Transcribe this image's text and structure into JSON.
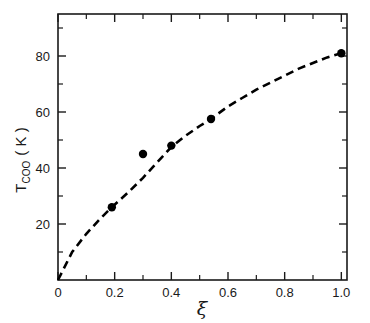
{
  "chart_data": {
    "type": "scatter",
    "title": "",
    "subtitle": "",
    "xlabel": "ξ",
    "ylabel": "T_COO (K)",
    "ylabel_parts": {
      "main": "T",
      "subscript": "COO",
      "units": "( K )"
    },
    "xlim": [
      0,
      1.02
    ],
    "ylim": [
      0,
      95
    ],
    "grid": false,
    "legend": null,
    "x_ticks": [
      0,
      0.2,
      0.4,
      0.6,
      0.8,
      1.0
    ],
    "x_tick_labels": [
      "0",
      "0.2",
      "0.4",
      "0.6",
      "0.8",
      "1.0"
    ],
    "x_minor_ticks": [
      0.1,
      0.3,
      0.5,
      0.7,
      0.9
    ],
    "y_ticks": [
      20,
      40,
      60,
      80
    ],
    "y_tick_labels": [
      "20",
      "40",
      "60",
      "80"
    ],
    "y_minor_ticks": [
      10,
      30,
      50,
      70,
      90
    ],
    "series": [
      {
        "name": "data",
        "marker": "filled-circle",
        "marker_color": "#000000",
        "points": [
          {
            "x": 0.19,
            "y": 26.0
          },
          {
            "x": 0.3,
            "y": 45.0
          },
          {
            "x": 0.4,
            "y": 48.0
          },
          {
            "x": 0.54,
            "y": 57.5
          },
          {
            "x": 1.0,
            "y": 81.0
          }
        ]
      },
      {
        "name": "fit-curve",
        "style": "dashed",
        "color": "#000000",
        "points": [
          {
            "x": 0.0,
            "y": 0.0
          },
          {
            "x": 0.05,
            "y": 10.0
          },
          {
            "x": 0.1,
            "y": 16.5
          },
          {
            "x": 0.15,
            "y": 22.0
          },
          {
            "x": 0.19,
            "y": 26.0
          },
          {
            "x": 0.25,
            "y": 31.5
          },
          {
            "x": 0.3,
            "y": 36.5
          },
          {
            "x": 0.35,
            "y": 42.0
          },
          {
            "x": 0.4,
            "y": 47.5
          },
          {
            "x": 0.45,
            "y": 51.5
          },
          {
            "x": 0.5,
            "y": 55.0
          },
          {
            "x": 0.54,
            "y": 57.5
          },
          {
            "x": 0.6,
            "y": 62.0
          },
          {
            "x": 0.65,
            "y": 65.0
          },
          {
            "x": 0.7,
            "y": 68.0
          },
          {
            "x": 0.75,
            "y": 70.5
          },
          {
            "x": 0.8,
            "y": 73.0
          },
          {
            "x": 0.85,
            "y": 75.5
          },
          {
            "x": 0.9,
            "y": 77.5
          },
          {
            "x": 0.95,
            "y": 79.5
          },
          {
            "x": 1.0,
            "y": 81.0
          }
        ]
      }
    ]
  },
  "axes": {
    "frame_color": "#1a1a1a",
    "background": "#ffffff"
  }
}
